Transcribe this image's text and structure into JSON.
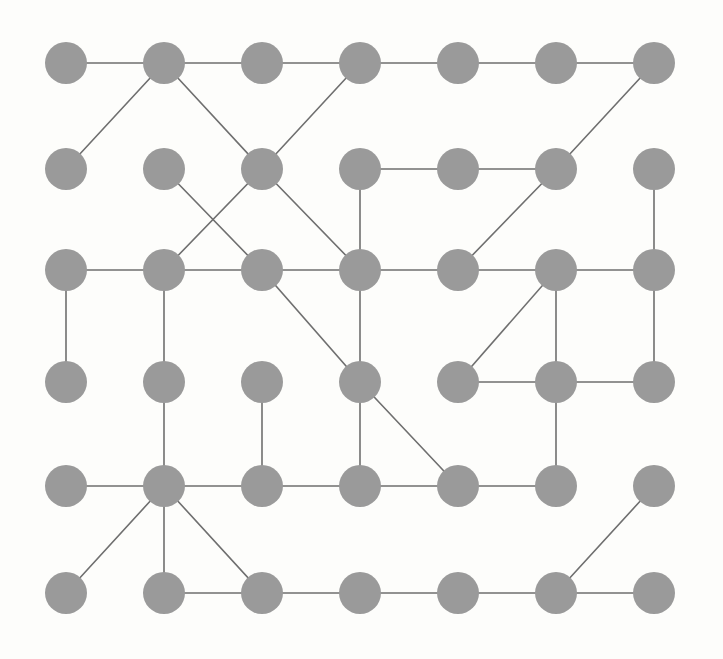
{
  "diagram": {
    "type": "node-link-graph",
    "background_color": "#fdfdfb",
    "node_color": "#9a9a9a",
    "edge_color": "#6f6f6f",
    "node_radius": 21,
    "edge_width": 1.6,
    "grid": {
      "columns": 7,
      "rows": 6,
      "origin_x": 66,
      "origin_y": 63,
      "col_spacing": 98,
      "row_spacing": 106
    },
    "node_count": 42,
    "edge_count": 44,
    "nodes": [
      {
        "id": "n0-0",
        "col": 0,
        "row": 0,
        "x": 66,
        "y": 63
      },
      {
        "id": "n1-0",
        "col": 1,
        "row": 0,
        "x": 164,
        "y": 63
      },
      {
        "id": "n2-0",
        "col": 2,
        "row": 0,
        "x": 262,
        "y": 63
      },
      {
        "id": "n3-0",
        "col": 3,
        "row": 0,
        "x": 360,
        "y": 63
      },
      {
        "id": "n4-0",
        "col": 4,
        "row": 0,
        "x": 458,
        "y": 63
      },
      {
        "id": "n5-0",
        "col": 5,
        "row": 0,
        "x": 556,
        "y": 63
      },
      {
        "id": "n6-0",
        "col": 6,
        "row": 0,
        "x": 654,
        "y": 63
      },
      {
        "id": "n0-1",
        "col": 0,
        "row": 1,
        "x": 66,
        "y": 169
      },
      {
        "id": "n1-1",
        "col": 1,
        "row": 1,
        "x": 164,
        "y": 169
      },
      {
        "id": "n2-1",
        "col": 2,
        "row": 1,
        "x": 262,
        "y": 169
      },
      {
        "id": "n3-1",
        "col": 3,
        "row": 1,
        "x": 360,
        "y": 169
      },
      {
        "id": "n4-1",
        "col": 4,
        "row": 1,
        "x": 458,
        "y": 169
      },
      {
        "id": "n5-1",
        "col": 5,
        "row": 1,
        "x": 556,
        "y": 169
      },
      {
        "id": "n6-1",
        "col": 6,
        "row": 1,
        "x": 654,
        "y": 169
      },
      {
        "id": "n0-2",
        "col": 0,
        "row": 2,
        "x": 66,
        "y": 270
      },
      {
        "id": "n1-2",
        "col": 1,
        "row": 2,
        "x": 164,
        "y": 270
      },
      {
        "id": "n2-2",
        "col": 2,
        "row": 2,
        "x": 262,
        "y": 270
      },
      {
        "id": "n3-2",
        "col": 3,
        "row": 2,
        "x": 360,
        "y": 270
      },
      {
        "id": "n4-2",
        "col": 4,
        "row": 2,
        "x": 458,
        "y": 270
      },
      {
        "id": "n5-2",
        "col": 5,
        "row": 2,
        "x": 556,
        "y": 270
      },
      {
        "id": "n6-2",
        "col": 6,
        "row": 2,
        "x": 654,
        "y": 270
      },
      {
        "id": "n0-3",
        "col": 0,
        "row": 3,
        "x": 66,
        "y": 382
      },
      {
        "id": "n1-3",
        "col": 1,
        "row": 3,
        "x": 164,
        "y": 382
      },
      {
        "id": "n2-3",
        "col": 2,
        "row": 3,
        "x": 262,
        "y": 382
      },
      {
        "id": "n3-3",
        "col": 3,
        "row": 3,
        "x": 360,
        "y": 382
      },
      {
        "id": "n4-3",
        "col": 4,
        "row": 3,
        "x": 458,
        "y": 382
      },
      {
        "id": "n5-3",
        "col": 5,
        "row": 3,
        "x": 556,
        "y": 382
      },
      {
        "id": "n6-3",
        "col": 6,
        "row": 3,
        "x": 654,
        "y": 382
      },
      {
        "id": "n0-4",
        "col": 0,
        "row": 4,
        "x": 66,
        "y": 486
      },
      {
        "id": "n1-4",
        "col": 1,
        "row": 4,
        "x": 164,
        "y": 486
      },
      {
        "id": "n2-4",
        "col": 2,
        "row": 4,
        "x": 262,
        "y": 486
      },
      {
        "id": "n3-4",
        "col": 3,
        "row": 4,
        "x": 360,
        "y": 486
      },
      {
        "id": "n4-4",
        "col": 4,
        "row": 4,
        "x": 458,
        "y": 486
      },
      {
        "id": "n5-4",
        "col": 5,
        "row": 4,
        "x": 556,
        "y": 486
      },
      {
        "id": "n6-4",
        "col": 6,
        "row": 4,
        "x": 654,
        "y": 486
      },
      {
        "id": "n0-5",
        "col": 0,
        "row": 5,
        "x": 66,
        "y": 593
      },
      {
        "id": "n1-5",
        "col": 1,
        "row": 5,
        "x": 164,
        "y": 593
      },
      {
        "id": "n2-5",
        "col": 2,
        "row": 5,
        "x": 262,
        "y": 593
      },
      {
        "id": "n3-5",
        "col": 3,
        "row": 5,
        "x": 360,
        "y": 593
      },
      {
        "id": "n4-5",
        "col": 4,
        "row": 5,
        "x": 458,
        "y": 593
      },
      {
        "id": "n5-5",
        "col": 5,
        "row": 5,
        "x": 556,
        "y": 593
      },
      {
        "id": "n6-5",
        "col": 6,
        "row": 5,
        "x": 654,
        "y": 593
      }
    ],
    "edges": [
      {
        "source": "n0-0",
        "target": "n1-0"
      },
      {
        "source": "n1-0",
        "target": "n2-0"
      },
      {
        "source": "n2-0",
        "target": "n3-0"
      },
      {
        "source": "n3-0",
        "target": "n4-0"
      },
      {
        "source": "n4-0",
        "target": "n5-0"
      },
      {
        "source": "n5-0",
        "target": "n6-0"
      },
      {
        "source": "n1-0",
        "target": "n0-1"
      },
      {
        "source": "n1-0",
        "target": "n2-1"
      },
      {
        "source": "n3-0",
        "target": "n2-1"
      },
      {
        "source": "n6-0",
        "target": "n5-1"
      },
      {
        "source": "n3-1",
        "target": "n4-1"
      },
      {
        "source": "n4-1",
        "target": "n5-1"
      },
      {
        "source": "n1-1",
        "target": "n2-2"
      },
      {
        "source": "n2-1",
        "target": "n1-2"
      },
      {
        "source": "n2-1",
        "target": "n3-2"
      },
      {
        "source": "n3-1",
        "target": "n3-2"
      },
      {
        "source": "n5-1",
        "target": "n4-2"
      },
      {
        "source": "n6-1",
        "target": "n6-2"
      },
      {
        "source": "n0-2",
        "target": "n1-2"
      },
      {
        "source": "n1-2",
        "target": "n2-2"
      },
      {
        "source": "n2-2",
        "target": "n3-2"
      },
      {
        "source": "n3-2",
        "target": "n4-2"
      },
      {
        "source": "n4-2",
        "target": "n5-2"
      },
      {
        "source": "n5-2",
        "target": "n6-2"
      },
      {
        "source": "n0-2",
        "target": "n0-3"
      },
      {
        "source": "n1-2",
        "target": "n1-3"
      },
      {
        "source": "n2-2",
        "target": "n3-3"
      },
      {
        "source": "n3-2",
        "target": "n3-3"
      },
      {
        "source": "n5-2",
        "target": "n4-3"
      },
      {
        "source": "n5-2",
        "target": "n5-3"
      },
      {
        "source": "n6-2",
        "target": "n6-3"
      },
      {
        "source": "n4-3",
        "target": "n5-3"
      },
      {
        "source": "n5-3",
        "target": "n6-3"
      },
      {
        "source": "n1-3",
        "target": "n1-4"
      },
      {
        "source": "n2-3",
        "target": "n2-4"
      },
      {
        "source": "n3-3",
        "target": "n3-4"
      },
      {
        "source": "n3-3",
        "target": "n4-4"
      },
      {
        "source": "n5-3",
        "target": "n5-4"
      },
      {
        "source": "n0-4",
        "target": "n1-4"
      },
      {
        "source": "n1-4",
        "target": "n2-4"
      },
      {
        "source": "n2-4",
        "target": "n3-4"
      },
      {
        "source": "n3-4",
        "target": "n4-4"
      },
      {
        "source": "n4-4",
        "target": "n5-4"
      },
      {
        "source": "n1-4",
        "target": "n0-5"
      },
      {
        "source": "n1-4",
        "target": "n1-5"
      },
      {
        "source": "n1-4",
        "target": "n2-5"
      },
      {
        "source": "n1-5",
        "target": "n2-5"
      },
      {
        "source": "n2-5",
        "target": "n3-5"
      },
      {
        "source": "n3-5",
        "target": "n4-5"
      },
      {
        "source": "n4-5",
        "target": "n5-5"
      },
      {
        "source": "n5-5",
        "target": "n6-5"
      },
      {
        "source": "n5-5",
        "target": "n6-4"
      }
    ]
  }
}
